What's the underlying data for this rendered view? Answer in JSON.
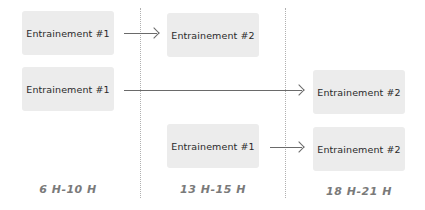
{
  "diagram": {
    "columns": [
      {
        "label": "6 H-10 H"
      },
      {
        "label": "13 H-15 H"
      },
      {
        "label": "18 H-21 H"
      }
    ],
    "rows": [
      {
        "from": "Entrainement #1",
        "to": "Entrainement #2",
        "from_slot": "6 H-10 H",
        "to_slot": "13 H-15 H"
      },
      {
        "from": "Entrainement #1",
        "to": "Entrainement #2",
        "from_slot": "6 H-10 H",
        "to_slot": "18 H-21 H"
      },
      {
        "from": "Entrainement #1",
        "to": "Entrainement #2",
        "from_slot": "13 H-15 H",
        "to_slot": "18 H-21 H"
      }
    ],
    "colors": {
      "box_fill": "#ececec",
      "arrow": "#6a6a6a",
      "divider": "#b0b0b0",
      "label": "#7a7a7a"
    }
  }
}
